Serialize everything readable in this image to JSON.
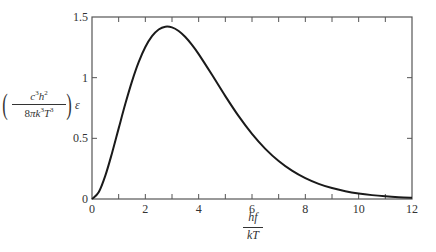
{
  "chart_data": {
    "type": "line",
    "title": "",
    "xlabel": {
      "numerator": "hf",
      "denominator": "kT"
    },
    "ylabel": {
      "numerator_parts": [
        {
          "base": "c",
          "exp": "3"
        },
        {
          "base": "h",
          "exp": "2"
        }
      ],
      "denominator_parts": [
        {
          "base": "8",
          "exp": ""
        },
        {
          "base": "π",
          "exp": ""
        },
        {
          "base": "k",
          "exp": "3"
        },
        {
          "base": "T",
          "exp": "3"
        }
      ],
      "suffix": "ε"
    },
    "xlim": [
      0,
      12
    ],
    "ylim": [
      0,
      1.5
    ],
    "xticks": [
      0,
      2,
      4,
      6,
      8,
      10,
      12
    ],
    "xtick_labels": [
      "0",
      "2",
      "4",
      "6",
      "8",
      "10",
      "12"
    ],
    "xminor_step": 1,
    "yticks": [
      0,
      0.5,
      1,
      1.5
    ],
    "ytick_labels": [
      "0",
      "0.5",
      "1",
      "1.5"
    ],
    "grid": false,
    "legend": "none",
    "series": [
      {
        "name": "x^3/(e^x-1)",
        "color": "#1a1a1a",
        "x": [
          0,
          0.25,
          0.5,
          0.75,
          1,
          1.25,
          1.5,
          1.75,
          2,
          2.25,
          2.5,
          2.75,
          3,
          3.25,
          3.5,
          3.75,
          4,
          4.5,
          5,
          5.5,
          6,
          6.5,
          7,
          7.5,
          8,
          8.5,
          9,
          9.5,
          10,
          10.5,
          11,
          11.5,
          12
        ],
        "y": [
          0,
          0.055,
          0.1927,
          0.3777,
          0.582,
          0.7843,
          0.9693,
          1.1272,
          1.2521,
          1.342,
          1.3973,
          1.4203,
          1.4147,
          1.3847,
          1.335,
          1.27,
          1.1941,
          1.0237,
          0.848,
          0.6827,
          0.5367,
          0.4135,
          0.3131,
          0.2335,
          0.1718,
          0.125,
          0.09,
          0.0642,
          0.0454,
          0.0319,
          0.0222,
          0.0154,
          0.0106
        ]
      }
    ]
  }
}
